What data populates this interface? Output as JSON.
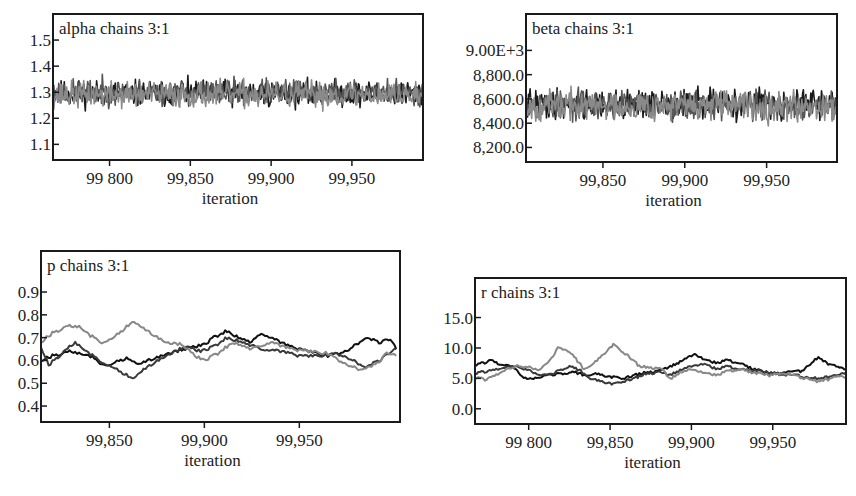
{
  "chart_data": [
    {
      "id": "alpha",
      "type": "line",
      "title": "alpha chains 3:1",
      "xlabel": "iteration",
      "ylabel": "",
      "box": {
        "x": 53,
        "y": 14,
        "w": 370,
        "h": 146
      },
      "xlim": [
        99765,
        99994
      ],
      "ylim": [
        1.04,
        1.6
      ],
      "xticks": [
        99800,
        99850,
        99900,
        99950
      ],
      "xtick_labels": [
        "99 800",
        "99,850",
        "99,900",
        "99,950"
      ],
      "yticks": [
        1.1,
        1.2,
        1.3,
        1.4,
        1.5
      ],
      "ytick_labels": [
        "1.1",
        "1.2",
        "1.3",
        "1.4",
        "1.5"
      ],
      "grid": false,
      "legend": "none",
      "series": [
        {
          "name": "chain 1",
          "color": "#1a1a1a",
          "mean": 1.295,
          "sd": 0.035,
          "seed": 11,
          "mode": "noise"
        },
        {
          "name": "chain 2",
          "color": "#555555",
          "mean": 1.3,
          "sd": 0.035,
          "seed": 23,
          "mode": "noise"
        },
        {
          "name": "chain 3",
          "color": "#8a8a8a",
          "mean": 1.29,
          "sd": 0.035,
          "seed": 37,
          "mode": "noise"
        }
      ]
    },
    {
      "id": "beta",
      "type": "line",
      "title": "beta chains 3:1",
      "xlabel": "iteration",
      "ylabel": "",
      "box": {
        "x": 526,
        "y": 14,
        "w": 311,
        "h": 148
      },
      "xlim": [
        99803,
        99993
      ],
      "ylim": [
        8080,
        9300
      ],
      "xticks": [
        99850,
        99900,
        99950
      ],
      "xtick_labels": [
        "99,850",
        "99,900",
        "99,950"
      ],
      "yticks": [
        8200,
        8400,
        8600,
        8800,
        9000
      ],
      "ytick_labels": [
        "8,200.0",
        "8,400.0",
        "8,600.0",
        "8,800.0",
        "9.00E+3"
      ],
      "grid": false,
      "legend": "none",
      "series": [
        {
          "name": "chain 1",
          "color": "#1a1a1a",
          "mean": 8560,
          "sd": 85,
          "seed": 41,
          "mode": "noise"
        },
        {
          "name": "chain 2",
          "color": "#555555",
          "mean": 8550,
          "sd": 85,
          "seed": 53,
          "mode": "noise"
        },
        {
          "name": "chain 3",
          "color": "#8a8a8a",
          "mean": 8545,
          "sd": 85,
          "seed": 67,
          "mode": "noise"
        }
      ]
    },
    {
      "id": "p",
      "type": "line",
      "title": "p chains 3:1",
      "xlabel": "iteration",
      "ylabel": "",
      "box": {
        "x": 41,
        "y": 251,
        "w": 359,
        "h": 171
      },
      "xlim": [
        99814,
        100003
      ],
      "ylim": [
        0.33,
        1.08
      ],
      "xticks": [
        99850,
        99900,
        99950
      ],
      "xtick_labels": [
        "99,850",
        "99,900",
        "99,950"
      ],
      "yticks": [
        0.4,
        0.5,
        0.6,
        0.7,
        0.8,
        0.9
      ],
      "ytick_labels": [
        "0.4",
        "0.5",
        "0.6",
        "0.7",
        "0.8",
        "0.9"
      ],
      "grid": false,
      "legend": "none",
      "series": [
        {
          "name": "chain 1",
          "color": "#111111",
          "mode": "path",
          "points": [
            [
              99814,
              0.6
            ],
            [
              99820,
              0.62
            ],
            [
              99830,
              0.64
            ],
            [
              99840,
              0.62
            ],
            [
              99845,
              0.59
            ],
            [
              99850,
              0.58
            ],
            [
              99855,
              0.6
            ],
            [
              99860,
              0.61
            ],
            [
              99865,
              0.58
            ],
            [
              99870,
              0.6
            ],
            [
              99880,
              0.63
            ],
            [
              99890,
              0.65
            ],
            [
              99900,
              0.67
            ],
            [
              99905,
              0.7
            ],
            [
              99912,
              0.73
            ],
            [
              99918,
              0.7
            ],
            [
              99925,
              0.68
            ],
            [
              99930,
              0.72
            ],
            [
              99935,
              0.7
            ],
            [
              99945,
              0.66
            ],
            [
              99955,
              0.64
            ],
            [
              99965,
              0.62
            ],
            [
              99975,
              0.64
            ],
            [
              99985,
              0.7
            ],
            [
              99992,
              0.68
            ],
            [
              99998,
              0.69
            ],
            [
              100001,
              0.65
            ]
          ]
        },
        {
          "name": "chain 2",
          "color": "#3a3a3a",
          "mode": "path",
          "points": [
            [
              99814,
              0.66
            ],
            [
              99818,
              0.58
            ],
            [
              99825,
              0.63
            ],
            [
              99832,
              0.68
            ],
            [
              99838,
              0.64
            ],
            [
              99845,
              0.6
            ],
            [
              99852,
              0.57
            ],
            [
              99858,
              0.54
            ],
            [
              99863,
              0.52
            ],
            [
              99868,
              0.56
            ],
            [
              99875,
              0.6
            ],
            [
              99882,
              0.63
            ],
            [
              99890,
              0.66
            ],
            [
              99898,
              0.64
            ],
            [
              99905,
              0.66
            ],
            [
              99912,
              0.7
            ],
            [
              99920,
              0.68
            ],
            [
              99930,
              0.65
            ],
            [
              99940,
              0.64
            ],
            [
              99950,
              0.62
            ],
            [
              99960,
              0.62
            ],
            [
              99970,
              0.63
            ],
            [
              99978,
              0.6
            ],
            [
              99985,
              0.57
            ],
            [
              99992,
              0.6
            ],
            [
              100001,
              0.65
            ]
          ]
        },
        {
          "name": "chain 3",
          "color": "#888888",
          "mode": "path",
          "points": [
            [
              99814,
              0.68
            ],
            [
              99820,
              0.72
            ],
            [
              99828,
              0.75
            ],
            [
              99834,
              0.75
            ],
            [
              99840,
              0.71
            ],
            [
              99846,
              0.68
            ],
            [
              99852,
              0.7
            ],
            [
              99858,
              0.74
            ],
            [
              99862,
              0.77
            ],
            [
              99868,
              0.74
            ],
            [
              99874,
              0.71
            ],
            [
              99880,
              0.68
            ],
            [
              99888,
              0.67
            ],
            [
              99895,
              0.62
            ],
            [
              99900,
              0.6
            ],
            [
              99907,
              0.63
            ],
            [
              99915,
              0.68
            ],
            [
              99925,
              0.65
            ],
            [
              99935,
              0.68
            ],
            [
              99945,
              0.65
            ],
            [
              99955,
              0.64
            ],
            [
              99965,
              0.63
            ],
            [
              99975,
              0.58
            ],
            [
              99982,
              0.56
            ],
            [
              99990,
              0.58
            ],
            [
              99996,
              0.63
            ],
            [
              100001,
              0.62
            ]
          ]
        }
      ]
    },
    {
      "id": "r",
      "type": "line",
      "title": "r chains 3:1",
      "xlabel": "iteration",
      "ylabel": "",
      "box": {
        "x": 475,
        "y": 278,
        "w": 371,
        "h": 146
      },
      "xlim": [
        99767,
        99995
      ],
      "ylim": [
        -2.5,
        21.5
      ],
      "xticks": [
        99800,
        99850,
        99900,
        99950
      ],
      "xtick_labels": [
        "99 800",
        "99,850",
        "99,900",
        "99,950"
      ],
      "yticks": [
        0.0,
        5.0,
        10.0,
        15.0
      ],
      "ytick_labels": [
        "0.0",
        "5.0",
        "10.0",
        "15.0"
      ],
      "grid": false,
      "legend": "none",
      "series": [
        {
          "name": "chain 1",
          "color": "#111111",
          "mode": "path",
          "points": [
            [
              99767,
              7.2
            ],
            [
              99772,
              7.5
            ],
            [
              99777,
              8.0
            ],
            [
              99782,
              7.2
            ],
            [
              99790,
              7.0
            ],
            [
              99795,
              5.5
            ],
            [
              99800,
              4.8
            ],
            [
              99805,
              5.2
            ],
            [
              99812,
              5.5
            ],
            [
              99820,
              5.8
            ],
            [
              99828,
              6.0
            ],
            [
              99835,
              5.5
            ],
            [
              99842,
              5.8
            ],
            [
              99850,
              5.2
            ],
            [
              99858,
              5.0
            ],
            [
              99865,
              5.5
            ],
            [
              99872,
              6.0
            ],
            [
              99880,
              6.2
            ],
            [
              99888,
              7.0
            ],
            [
              99895,
              8.0
            ],
            [
              99902,
              9.0
            ],
            [
              99908,
              8.2
            ],
            [
              99915,
              7.5
            ],
            [
              99922,
              8.0
            ],
            [
              99930,
              7.5
            ],
            [
              99938,
              6.5
            ],
            [
              99945,
              6.0
            ],
            [
              99952,
              5.8
            ],
            [
              99960,
              6.0
            ],
            [
              99967,
              6.2
            ],
            [
              99972,
              7.0
            ],
            [
              99978,
              8.5
            ],
            [
              99983,
              7.5
            ],
            [
              99990,
              7.0
            ],
            [
              99995,
              6.5
            ]
          ]
        },
        {
          "name": "chain 2",
          "color": "#3a3a3a",
          "mode": "path",
          "points": [
            [
              99767,
              5.8
            ],
            [
              99775,
              6.2
            ],
            [
              99782,
              6.5
            ],
            [
              99790,
              7.0
            ],
            [
              99798,
              6.5
            ],
            [
              99805,
              5.8
            ],
            [
              99812,
              5.5
            ],
            [
              99818,
              6.2
            ],
            [
              99825,
              7.0
            ],
            [
              99832,
              6.2
            ],
            [
              99838,
              5.0
            ],
            [
              99845,
              4.5
            ],
            [
              99852,
              4.0
            ],
            [
              99858,
              4.5
            ],
            [
              99865,
              5.0
            ],
            [
              99872,
              5.8
            ],
            [
              99880,
              6.0
            ],
            [
              99887,
              5.5
            ],
            [
              99892,
              6.2
            ],
            [
              99900,
              7.0
            ],
            [
              99908,
              7.5
            ],
            [
              99915,
              6.5
            ],
            [
              99922,
              7.0
            ],
            [
              99930,
              6.5
            ],
            [
              99940,
              6.2
            ],
            [
              99950,
              5.8
            ],
            [
              99958,
              5.5
            ],
            [
              99965,
              5.5
            ],
            [
              99972,
              5.0
            ],
            [
              99980,
              5.0
            ],
            [
              99988,
              5.5
            ],
            [
              99995,
              6.0
            ]
          ]
        },
        {
          "name": "chain 3",
          "color": "#888888",
          "mode": "path",
          "points": [
            [
              99767,
              5.2
            ],
            [
              99773,
              4.8
            ],
            [
              99780,
              5.5
            ],
            [
              99787,
              6.5
            ],
            [
              99793,
              7.0
            ],
            [
              99800,
              6.8
            ],
            [
              99806,
              6.5
            ],
            [
              99812,
              7.5
            ],
            [
              99818,
              10.0
            ],
            [
              99823,
              9.8
            ],
            [
              99828,
              8.5
            ],
            [
              99834,
              6.5
            ],
            [
              99840,
              7.5
            ],
            [
              99846,
              9.0
            ],
            [
              99852,
              10.5
            ],
            [
              99857,
              9.5
            ],
            [
              99862,
              8.5
            ],
            [
              99868,
              7.0
            ],
            [
              99875,
              6.8
            ],
            [
              99882,
              6.5
            ],
            [
              99887,
              4.8
            ],
            [
              99892,
              5.8
            ],
            [
              99900,
              6.5
            ],
            [
              99908,
              6.0
            ],
            [
              99915,
              5.5
            ],
            [
              99922,
              6.2
            ],
            [
              99930,
              6.5
            ],
            [
              99940,
              5.8
            ],
            [
              99948,
              5.5
            ],
            [
              99955,
              5.8
            ],
            [
              99962,
              5.5
            ],
            [
              99970,
              5.0
            ],
            [
              99977,
              4.5
            ],
            [
              99984,
              4.8
            ],
            [
              99990,
              5.5
            ],
            [
              99995,
              5.2
            ]
          ]
        }
      ]
    }
  ]
}
